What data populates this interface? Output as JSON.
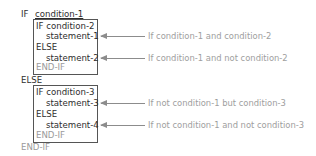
{
  "diagram": {
    "outer": {
      "if_keyword": "IF",
      "condition": "condition-1",
      "else_keyword": "ELSE",
      "end_keyword": "END-IF"
    },
    "inner_blocks": [
      {
        "if_line": "IF condition-2",
        "true_statement": "statement-1",
        "else_keyword": "ELSE",
        "false_statement": "statement-2",
        "end_keyword": "END-IF"
      },
      {
        "if_line": "IF condition-3",
        "true_statement": "statement-3",
        "else_keyword": "ELSE",
        "false_statement": "statement-4",
        "end_keyword": "END-IF"
      }
    ],
    "annotations": [
      {
        "arrow_icon": "arrow-left-icon",
        "text": "If condition-1 and condition-2"
      },
      {
        "arrow_icon": "arrow-left-icon",
        "text": "If condition-1 and not condition-2"
      },
      {
        "arrow_icon": "arrow-left-icon",
        "text": "If not condition-1 but condition-3"
      },
      {
        "arrow_icon": "arrow-left-icon",
        "text": "If not condition-1 and not condition-3"
      }
    ],
    "colors": {
      "text": "#333333",
      "muted": "#9a9a9a",
      "box_border": "#555555",
      "arrow": "#8c8c8c"
    }
  }
}
